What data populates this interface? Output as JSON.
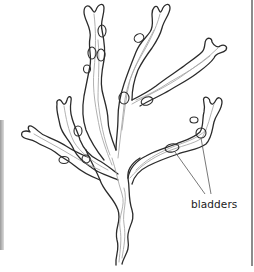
{
  "figure": {
    "labels": [
      {
        "id": "bladders",
        "text": "bladders",
        "points_to": [
          "bladder-right-lower",
          "bladder-right-upper"
        ]
      }
    ],
    "colors": {
      "outline": "#2b2b2b",
      "midrib": "#a8a8a8",
      "background": "#ffffff"
    }
  }
}
